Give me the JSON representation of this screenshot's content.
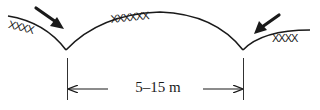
{
  "diagram": {
    "dimension_label": "5–15 m",
    "hatch": {
      "left": "XXXX",
      "center": "XXXXXX",
      "right": "XXXX"
    },
    "elements": [
      {
        "name": "left-slope",
        "description": "ground surface sloping down into left trough"
      },
      {
        "name": "central-mound",
        "description": "convex arch between two troughs"
      },
      {
        "name": "right-slope",
        "description": "ground surface rising from right trough"
      },
      {
        "name": "left-arrow",
        "description": "bold arrow pointing into left trough"
      },
      {
        "name": "right-arrow",
        "description": "bold arrow pointing into right trough"
      },
      {
        "name": "dimension",
        "description": "spacing between troughs"
      }
    ],
    "colors": {
      "stroke": "#1a1a1a",
      "background": "#ffffff"
    }
  }
}
